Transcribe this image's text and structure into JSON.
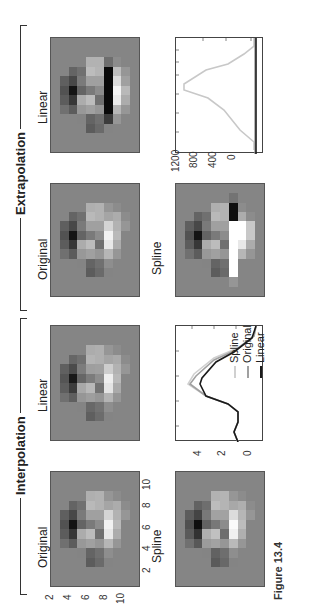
{
  "figure": {
    "caption": "Figure 13.4",
    "groups": [
      {
        "title": "Extrapolation",
        "panels": [
          "Original",
          "Linear",
          "Spline"
        ]
      },
      {
        "title": "Interpolation",
        "panels": [
          "Original",
          "Linear",
          "Spline"
        ]
      }
    ]
  },
  "labels": {
    "extrapolation": "Extrapolation",
    "interpolation": "Interpolation",
    "extrap_original": "Original",
    "extrap_linear": "Linear",
    "extrap_spline": "Spline",
    "interp_original": "Original",
    "interp_linear": "Linear",
    "interp_spline": "Spline"
  },
  "axes": {
    "image_y_ticks": [
      "2",
      "4",
      "6",
      "8",
      "10"
    ],
    "image_x_ticks": [
      "2",
      "4",
      "6",
      "8",
      "10"
    ],
    "extrap_chart_y_ticks": [
      "1200",
      "800",
      "400",
      "0"
    ],
    "interp_chart_y_ticks": [
      "4",
      "2",
      "0"
    ]
  },
  "legend": {
    "spline": "Spline",
    "original": "Original",
    "linear": "Linear"
  },
  "colors": {
    "background_gray": "#858585",
    "spline_line": "#c8c8c8",
    "original_line": "#999999",
    "linear_line": "#1a1a1a"
  },
  "chart_data": [
    {
      "type": "heatmap",
      "title": "Extrapolation - Original",
      "grid": "12x10 grayscale, values 0-255 (screen orientation)"
    },
    {
      "type": "line",
      "title": "Extrapolation profile",
      "ylabel": "",
      "ylim": [
        -100,
        1300
      ],
      "y_ticks": [
        0,
        400,
        800,
        1200
      ],
      "series": [
        {
          "name": "Spline",
          "values": [
            0,
            0,
            100,
            350,
            750,
            1200,
            1200,
            800,
            350,
            0,
            0
          ]
        },
        {
          "name": "Original",
          "values": [
            0,
            0,
            0,
            0,
            0,
            0,
            0,
            0,
            0,
            0,
            0
          ]
        },
        {
          "name": "Linear",
          "values": [
            0,
            0,
            0,
            0,
            0,
            0,
            0,
            0,
            0,
            0,
            0
          ]
        }
      ]
    },
    {
      "type": "line",
      "title": "Interpolation profile",
      "ylabel": "",
      "ylim": [
        -1.5,
        5
      ],
      "y_ticks": [
        0,
        2,
        4
      ],
      "series": [
        {
          "name": "Spline",
          "values": [
            0,
            0,
            -0.2,
            -1.0,
            0.8,
            4.2,
            3.6,
            2.5,
            1.2,
            0.0,
            -0.2
          ]
        },
        {
          "name": "Original",
          "values": [
            0,
            0,
            -0.2,
            -1.0,
            0.8,
            4.0,
            3.2,
            2.2,
            1.0,
            0.0,
            -0.2
          ]
        },
        {
          "name": "Linear",
          "values": [
            0,
            0,
            -0.2,
            -0.9,
            0.7,
            3.5,
            2.8,
            1.8,
            0.8,
            0.0,
            -0.2
          ]
        }
      ]
    }
  ]
}
